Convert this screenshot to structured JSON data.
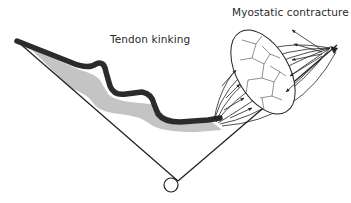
{
  "diagram": {
    "labels": {
      "tendon": "Tendon kinking",
      "muscle": "Myostatic contracture"
    },
    "colors": {
      "line": "#222222",
      "tendon": "#2b2b2b",
      "shadow": "#c4c4c4",
      "background": "#ffffff"
    },
    "elements": {
      "left_bone": "straight line from upper-left to joint",
      "right_bone": "straight line from upper-right to joint",
      "joint": "small circle at vertex (pivot)",
      "tendon": "thick wavy dark band with grey shadow",
      "muscle": "fusiform belly with cross-section of fascicles and arrows"
    }
  }
}
